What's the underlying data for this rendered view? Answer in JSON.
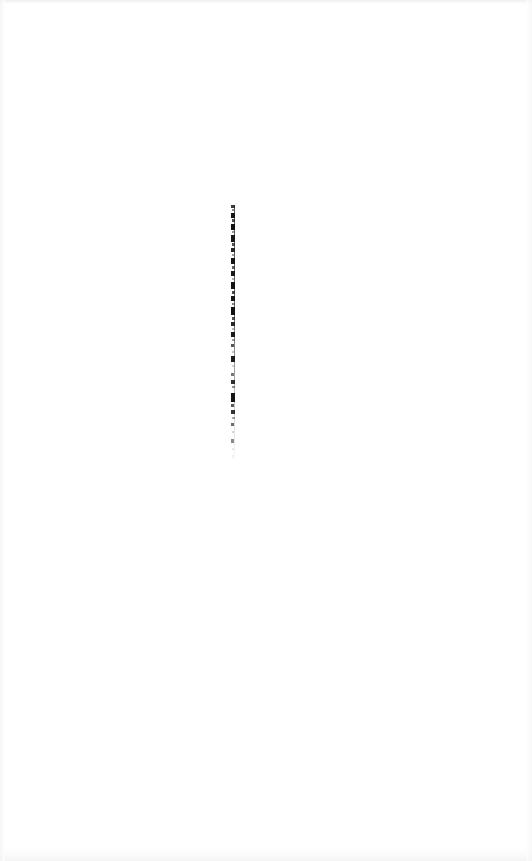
{
  "document": {
    "kind": "scanned-page",
    "page_background": "#ffffff",
    "ink_color": "#1a1a1a",
    "visible_text": "",
    "note": "Scanned sheet is blank apart from one narrow vertical column of illegible compressed ink marks."
  },
  "artifact": {
    "name": "vertical-ink-strip",
    "left": 230,
    "top": 205,
    "width": 7,
    "height": 255,
    "hairline_color": "#3c3c3c",
    "marks": [
      {
        "top": 0,
        "height": 3,
        "left": 1,
        "width": 4,
        "color": "#262626",
        "opacity": 0.9
      },
      {
        "top": 4,
        "height": 2,
        "left": 2,
        "width": 3,
        "color": "#555555",
        "opacity": 0.7
      },
      {
        "top": 8,
        "height": 5,
        "left": 1,
        "width": 4,
        "color": "#151515",
        "opacity": 1.0
      },
      {
        "top": 14,
        "height": 3,
        "left": 2,
        "width": 3,
        "color": "#2e2e2e",
        "opacity": 0.85
      },
      {
        "top": 19,
        "height": 6,
        "left": 1,
        "width": 4,
        "color": "#121212",
        "opacity": 1.0
      },
      {
        "top": 26,
        "height": 2,
        "left": 2,
        "width": 2,
        "color": "#606060",
        "opacity": 0.65
      },
      {
        "top": 30,
        "height": 7,
        "left": 1,
        "width": 4,
        "color": "#171717",
        "opacity": 1.0
      },
      {
        "top": 38,
        "height": 3,
        "left": 2,
        "width": 3,
        "color": "#333333",
        "opacity": 0.85
      },
      {
        "top": 43,
        "height": 4,
        "left": 1,
        "width": 4,
        "color": "#1c1c1c",
        "opacity": 0.95
      },
      {
        "top": 49,
        "height": 2,
        "left": 2,
        "width": 3,
        "color": "#5a5a5a",
        "opacity": 0.6
      },
      {
        "top": 53,
        "height": 6,
        "left": 1,
        "width": 4,
        "color": "#141414",
        "opacity": 1.0
      },
      {
        "top": 61,
        "height": 3,
        "left": 2,
        "width": 3,
        "color": "#383838",
        "opacity": 0.8
      },
      {
        "top": 66,
        "height": 5,
        "left": 1,
        "width": 4,
        "color": "#181818",
        "opacity": 1.0
      },
      {
        "top": 73,
        "height": 2,
        "left": 2,
        "width": 2,
        "color": "#6b6b6b",
        "opacity": 0.55
      },
      {
        "top": 77,
        "height": 7,
        "left": 1,
        "width": 4,
        "color": "#131313",
        "opacity": 1.0
      },
      {
        "top": 86,
        "height": 3,
        "left": 2,
        "width": 3,
        "color": "#2a2a2a",
        "opacity": 0.85
      },
      {
        "top": 91,
        "height": 5,
        "left": 1,
        "width": 4,
        "color": "#161616",
        "opacity": 1.0
      },
      {
        "top": 98,
        "height": 2,
        "left": 2,
        "width": 3,
        "color": "#4e4e4e",
        "opacity": 0.7
      },
      {
        "top": 102,
        "height": 8,
        "left": 1,
        "width": 4,
        "color": "#111111",
        "opacity": 1.0
      },
      {
        "top": 112,
        "height": 3,
        "left": 2,
        "width": 3,
        "color": "#313131",
        "opacity": 0.85
      },
      {
        "top": 117,
        "height": 4,
        "left": 1,
        "width": 4,
        "color": "#1d1d1d",
        "opacity": 0.95
      },
      {
        "top": 123,
        "height": 2,
        "left": 2,
        "width": 2,
        "color": "#707070",
        "opacity": 0.5
      },
      {
        "top": 127,
        "height": 5,
        "left": 1,
        "width": 4,
        "color": "#191919",
        "opacity": 1.0
      },
      {
        "top": 134,
        "height": 2,
        "left": 2,
        "width": 3,
        "color": "#585858",
        "opacity": 0.6
      },
      {
        "top": 139,
        "height": 3,
        "left": 1,
        "width": 3,
        "color": "#2b2b2b",
        "opacity": 0.8
      },
      {
        "top": 146,
        "height": 2,
        "left": 2,
        "width": 2,
        "color": "#7a7a7a",
        "opacity": 0.45
      },
      {
        "top": 151,
        "height": 6,
        "left": 1,
        "width": 4,
        "color": "#171717",
        "opacity": 0.98
      },
      {
        "top": 160,
        "height": 2,
        "left": 2,
        "width": 2,
        "color": "#8a8a8a",
        "opacity": 0.4
      },
      {
        "top": 168,
        "height": 3,
        "left": 1,
        "width": 3,
        "color": "#3d3d3d",
        "opacity": 0.7
      },
      {
        "top": 175,
        "height": 4,
        "left": 1,
        "width": 4,
        "color": "#1f1f1f",
        "opacity": 0.92
      },
      {
        "top": 181,
        "height": 2,
        "left": 2,
        "width": 3,
        "color": "#4a4a4a",
        "opacity": 0.6
      },
      {
        "top": 188,
        "height": 9,
        "left": 1,
        "width": 4,
        "color": "#151515",
        "opacity": 1.0
      },
      {
        "top": 199,
        "height": 3,
        "left": 1,
        "width": 3,
        "color": "#2f2f2f",
        "opacity": 0.8
      },
      {
        "top": 205,
        "height": 4,
        "left": 1,
        "width": 4,
        "color": "#1e1e1e",
        "opacity": 0.9
      },
      {
        "top": 212,
        "height": 2,
        "left": 2,
        "width": 3,
        "color": "#5f5f5f",
        "opacity": 0.55
      },
      {
        "top": 218,
        "height": 3,
        "left": 1,
        "width": 3,
        "color": "#353535",
        "opacity": 0.72
      },
      {
        "top": 226,
        "height": 2,
        "left": 2,
        "width": 2,
        "color": "#8f8f8f",
        "opacity": 0.38
      },
      {
        "top": 234,
        "height": 4,
        "left": 1,
        "width": 3,
        "color": "#3a3a3a",
        "opacity": 0.6
      },
      {
        "top": 243,
        "height": 2,
        "left": 2,
        "width": 2,
        "color": "#b4b4b4",
        "opacity": 0.3
      },
      {
        "top": 250,
        "height": 3,
        "left": 2,
        "width": 2,
        "color": "#c8c8c8",
        "opacity": 0.25
      }
    ]
  }
}
